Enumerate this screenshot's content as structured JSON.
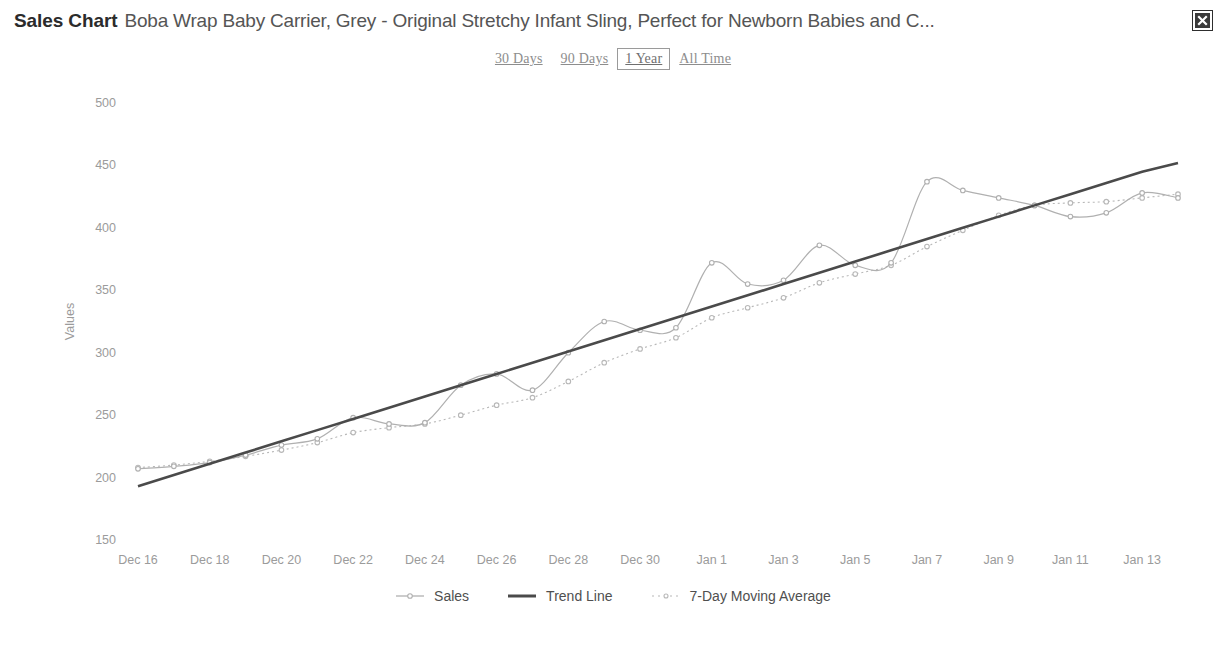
{
  "header": {
    "title_strong": "Sales Chart",
    "title_rest": "Boba Wrap Baby Carrier, Grey - Original Stretchy Infant Sling, Perfect for Newborn Babies and C...",
    "close_icon": "close-icon"
  },
  "range_tabs": [
    {
      "label": "30 Days",
      "active": false
    },
    {
      "label": "90 Days",
      "active": false
    },
    {
      "label": "1 Year",
      "active": true
    },
    {
      "label": "All Time",
      "active": false
    }
  ],
  "colors": {
    "sales_line": "#b0b0b0",
    "trend_line": "#4a4a4a",
    "moving_average": "#b8b8b8",
    "axis_text": "#9b9b9b",
    "title_strong": "#2b2b2b",
    "title_rest": "#555555",
    "close_bg": "#3a3a3a"
  },
  "chart_data": {
    "type": "line",
    "title": "Sales Chart",
    "xlabel": "",
    "ylabel": "Values",
    "ylim": [
      150,
      500
    ],
    "yticks": [
      150,
      200,
      250,
      300,
      350,
      400,
      450,
      500
    ],
    "grid": false,
    "legend_position": "bottom",
    "x": [
      "Dec 16",
      "Dec 17",
      "Dec 18",
      "Dec 19",
      "Dec 20",
      "Dec 21",
      "Dec 22",
      "Dec 23",
      "Dec 24",
      "Dec 25",
      "Dec 26",
      "Dec 27",
      "Dec 28",
      "Dec 29",
      "Dec 30",
      "Dec 31",
      "Jan 1",
      "Jan 2",
      "Jan 3",
      "Jan 4",
      "Jan 5",
      "Jan 6",
      "Jan 7",
      "Jan 8",
      "Jan 9",
      "Jan 10",
      "Jan 11",
      "Jan 12",
      "Jan 13",
      "Jan 14"
    ],
    "xticks": [
      "Dec 16",
      "Dec 18",
      "Dec 20",
      "Dec 22",
      "Dec 24",
      "Dec 26",
      "Dec 28",
      "Dec 30",
      "Jan 1",
      "Jan 3",
      "Jan 5",
      "Jan 7",
      "Jan 9",
      "Jan 11",
      "Jan 13"
    ],
    "series": [
      {
        "name": "Sales",
        "style": "line-markers",
        "color": "#b0b0b0",
        "values": [
          207,
          209,
          212,
          218,
          226,
          231,
          248,
          243,
          244,
          274,
          283,
          270,
          300,
          325,
          318,
          320,
          372,
          355,
          358,
          386,
          370,
          372,
          437,
          430,
          424,
          418,
          409,
          412,
          428,
          424
        ]
      },
      {
        "name": "Trend Line",
        "style": "solid",
        "color": "#4a4a4a",
        "values": [
          193,
          202,
          211,
          220,
          229,
          238,
          247,
          256,
          265,
          274,
          283,
          292,
          301,
          310,
          319,
          328,
          337,
          346,
          355,
          364,
          373,
          382,
          391,
          400,
          409,
          418,
          427,
          436,
          445,
          452
        ]
      },
      {
        "name": "7-Day Moving Average",
        "style": "dotted-markers",
        "color": "#b8b8b8",
        "values": [
          208,
          210,
          213,
          217,
          222,
          228,
          236,
          240,
          243,
          250,
          258,
          264,
          277,
          292,
          303,
          312,
          328,
          336,
          344,
          356,
          363,
          370,
          385,
          398,
          410,
          418,
          420,
          421,
          424,
          427
        ]
      }
    ]
  }
}
